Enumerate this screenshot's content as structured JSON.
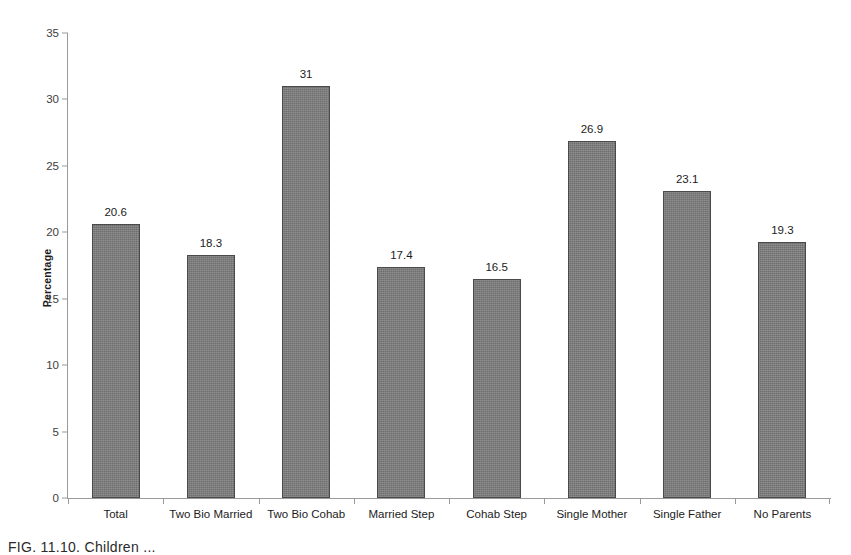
{
  "chart_data": {
    "type": "bar",
    "title": "",
    "xlabel": "",
    "ylabel": "Percentage",
    "ylim": [
      0,
      35
    ],
    "yticks": [
      0,
      5,
      10,
      15,
      20,
      25,
      30,
      35
    ],
    "ytick_labels": [
      "0",
      "5",
      "10",
      "15",
      "20",
      "25",
      "30",
      "35"
    ],
    "grid": false,
    "legend": false,
    "bar_color": "#6e6e6e",
    "bar_edge_color": "#4a4a4a",
    "axis_color": "#9a9a9a",
    "categories": [
      "Total",
      "Two Bio Married",
      "Two Bio Cohab",
      "Married Step",
      "Cohab Step",
      "Single Mother",
      "Single Father",
      "No Parents"
    ],
    "values": [
      20.6,
      18.3,
      31,
      17.4,
      16.5,
      26.9,
      23.1,
      19.3
    ],
    "value_labels": [
      "20.6",
      "18.3",
      "31",
      "17.4",
      "16.5",
      "26.9",
      "23.1",
      "19.3"
    ]
  },
  "caption": {
    "text": "FIG. 11.10.   Children ..."
  }
}
